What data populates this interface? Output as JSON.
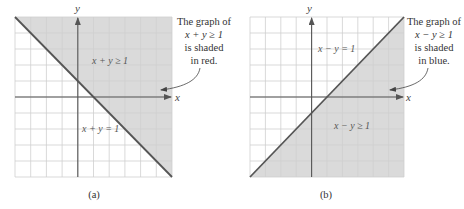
{
  "chart_data": [
    {
      "type": "area",
      "panel": "(a)",
      "title": "",
      "xlabel": "x",
      "ylabel": "y",
      "xlim": [
        -4,
        6
      ],
      "ylim": [
        -5,
        5
      ],
      "grid": true,
      "grid_step": 1,
      "boundary_line": {
        "equation": "x + y = 1",
        "slope": -1,
        "intercept": 1
      },
      "shaded_region": "x + y ≥ 1",
      "shaded_side": "above",
      "shade_color": "#dadada",
      "region_label": "x + y ≥ 1",
      "line_label": "x + y = 1",
      "annotation": [
        "The graph of",
        "x + y ≥ 1",
        "is shaded",
        "in red."
      ],
      "caption": "(a)"
    },
    {
      "type": "area",
      "panel": "(b)",
      "title": "",
      "xlabel": "x",
      "ylabel": "y",
      "xlim": [
        -4,
        6
      ],
      "ylim": [
        -5,
        5
      ],
      "grid": true,
      "grid_step": 1,
      "boundary_line": {
        "equation": "x − y = 1",
        "slope": 1,
        "intercept": -1
      },
      "shaded_region": "x − y ≥ 1",
      "shaded_side": "below",
      "shade_color": "#dadada",
      "region_label": "x − y ≥ 1",
      "line_label": "x − y = 1",
      "annotation": [
        "The graph of",
        "x − y ≥ 1",
        "is shaded",
        "in blue."
      ],
      "caption": "(b)"
    }
  ],
  "colors": {
    "grid": "#cfcfcf",
    "axis": "#555555",
    "boundary": "#555555",
    "shade": "#dadada",
    "text": "#333333"
  }
}
